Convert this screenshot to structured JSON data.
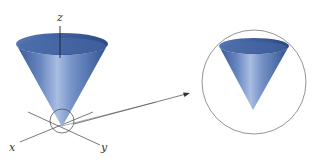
{
  "diagram": {
    "axes": {
      "z_label": "z",
      "x_label": "x",
      "y_label": "y"
    },
    "colors": {
      "cone_dark": "#3a5f9e",
      "cone_mid": "#6f8fc4",
      "cone_light": "#b8c8e6",
      "rim_inner": "#4a6ba8",
      "lines": "#555555",
      "background": "#ffffff"
    },
    "callout": {
      "source": "apex-circle",
      "target": "magnified-circle"
    }
  }
}
